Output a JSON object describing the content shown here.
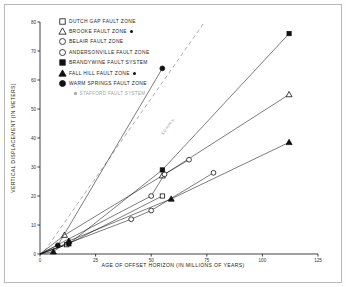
{
  "chart_data": {
    "type": "line",
    "title": "",
    "xlabel": "AGE OF OFFSET HORIZON (IN MILLIONS OF YEARS)",
    "ylabel": "VERTICAL DISPLACEMENT (IN METERS)",
    "xlim": [
      0,
      125
    ],
    "ylim": [
      0,
      80
    ],
    "xticks": [
      0,
      25,
      50,
      75,
      100,
      125
    ],
    "yticks": [
      0,
      10,
      20,
      30,
      40,
      50,
      60,
      70,
      80
    ],
    "grid": false,
    "legend_position": "upper-left-inside",
    "annotations": [
      {
        "text": "1.0 m/m.y.",
        "type": "reference-line-label",
        "x": 55,
        "y": 42
      }
    ],
    "reference_line": {
      "label": "1.0 m/m.y.",
      "style": "dashed",
      "points": [
        [
          2,
          1
        ],
        [
          74,
          80
        ]
      ]
    },
    "series": [
      {
        "name": "DUTCH GAP FAULT ZONE",
        "marker": "open-square",
        "stafford": false,
        "points": [
          [
            0,
            0
          ],
          [
            12,
            3.2
          ],
          [
            55,
            20.0
          ]
        ]
      },
      {
        "name": "BROOKE FAULT ZONE",
        "marker": "open-triangle",
        "stafford": true,
        "points": [
          [
            0,
            0
          ],
          [
            11,
            6.5
          ],
          [
            55,
            27.0
          ],
          [
            112,
            55.0
          ]
        ]
      },
      {
        "name": "BELAIR FAULT ZONE",
        "marker": "open-circle",
        "stafford": false,
        "points": [
          [
            0,
            0
          ],
          [
            50,
            20.0
          ],
          [
            56,
            27.5
          ],
          [
            67,
            32.5
          ]
        ]
      },
      {
        "name": "ANDERSONVILLE FAULT ZONE",
        "marker": "open-circle",
        "stafford": false,
        "points": [
          [
            0,
            0
          ],
          [
            41,
            12.0
          ],
          [
            50,
            15.0
          ],
          [
            78,
            28.0
          ]
        ]
      },
      {
        "name": "BRANDYWINE FAULT SYSTEM",
        "marker": "filled-square",
        "stafford": false,
        "points": [
          [
            0,
            0
          ],
          [
            13,
            3.5
          ],
          [
            55,
            29.0
          ],
          [
            112,
            76.0
          ]
        ]
      },
      {
        "name": "FALL HILL FAULT ZONE",
        "marker": "filled-triangle",
        "stafford": true,
        "points": [
          [
            0,
            0
          ],
          [
            6,
            0.8
          ],
          [
            13,
            4.5
          ],
          [
            59,
            19.0
          ],
          [
            112,
            38.5
          ]
        ]
      },
      {
        "name": "WARM SPRINGS FAULT ZONE",
        "marker": "filled-circle",
        "stafford": false,
        "points": [
          [
            0,
            0
          ],
          [
            8,
            3.0
          ],
          [
            55,
            64.0
          ]
        ]
      }
    ],
    "stafford_note": "STAFFORD FAULT SYSTEM"
  },
  "legend": {
    "items": [
      {
        "label": "DUTCH GAP FAULT ZONE",
        "marker": "open-square",
        "dot": false
      },
      {
        "label": "BROOKE FAULT ZONE",
        "marker": "open-triangle",
        "dot": true
      },
      {
        "label": "BELAIR FAULT ZONE",
        "marker": "open-circle",
        "dot": false
      },
      {
        "label": "ANDERSONVILLE FAULT ZONE",
        "marker": "open-circle",
        "dot": false
      },
      {
        "label": "BRANDYWINE FAULT SYSTEM",
        "marker": "filled-square",
        "dot": false
      },
      {
        "label": "FALL HILL FAULT ZONE",
        "marker": "filled-triangle",
        "dot": true
      },
      {
        "label": "WARM SPRINGS FAULT ZONE",
        "marker": "filled-circle",
        "dot": false
      }
    ],
    "note": "STAFFORD FAULT SYSTEM"
  },
  "colors": {
    "ink": "#111111",
    "frame": "#b9b9b9",
    "reference": "#9a9a9a",
    "note": "#a0a0a0"
  }
}
